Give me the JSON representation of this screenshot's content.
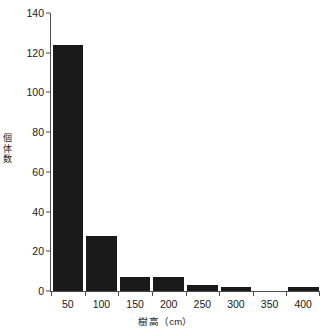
{
  "chart_data": {
    "type": "bar",
    "title": "",
    "subtitle": "",
    "xlabel": "樹高（cm）",
    "ylabel": "個体数",
    "categories": [
      "50",
      "100",
      "150",
      "200",
      "250",
      "300",
      "350",
      "400"
    ],
    "values": [
      124,
      27.5,
      7,
      7,
      3,
      2,
      0,
      2
    ],
    "series": [
      {
        "name": "個体数",
        "values": [
          124,
          27.5,
          7,
          7,
          3,
          2,
          0,
          2
        ]
      }
    ],
    "ylim": [
      0,
      140
    ],
    "yticks": [
      0,
      20,
      40,
      60,
      80,
      100,
      120,
      140
    ],
    "ytick_labels": [
      "0",
      "20",
      "40",
      "60",
      "80",
      "100",
      "120",
      "140"
    ],
    "xtick_labels": [
      "50",
      "100",
      "150",
      "200",
      "250",
      "300",
      "350",
      "400"
    ],
    "grid": false,
    "legend": false,
    "legend_position": "none",
    "bar_color": "#1a1a1a",
    "background_color": "#ffffff",
    "axis_color": "#4d4d4d",
    "text_color": "#1a1a1a",
    "annotations": []
  }
}
